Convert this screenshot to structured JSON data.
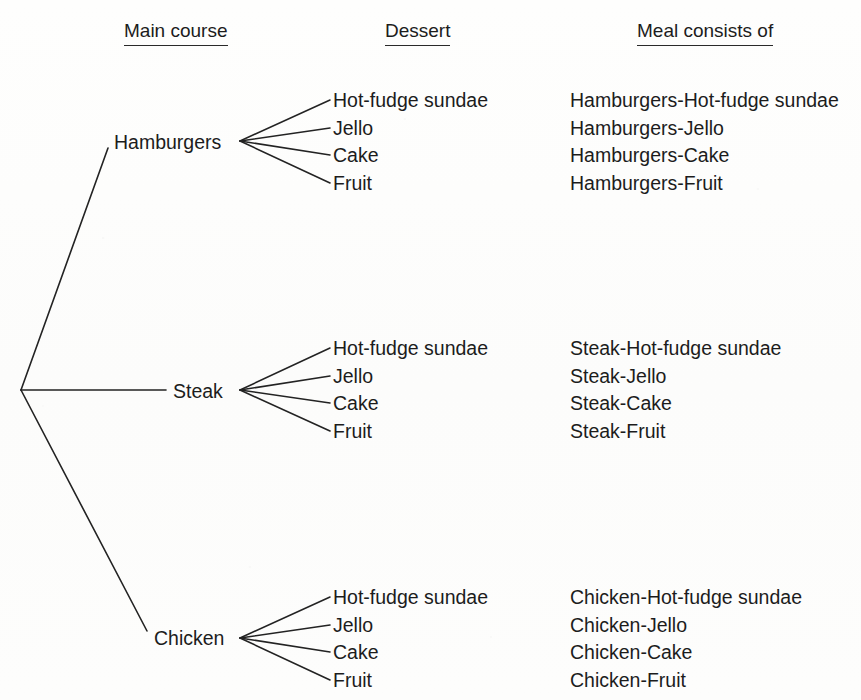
{
  "headers": [
    {
      "label": "Main course",
      "x": 124,
      "y": 20
    },
    {
      "label": "Dessert",
      "x": 385,
      "y": 20
    },
    {
      "label": "Meal consists of",
      "x": 637,
      "y": 20
    }
  ],
  "root": {
    "x": 21,
    "y": 390
  },
  "branches": [
    {
      "main_course": "Hamburgers",
      "label_x": 114,
      "label_y": 131,
      "vertex_x": 240,
      "vertex_y": 141,
      "edge_from_root_end_x": 108,
      "edge_from_root_end_y": 148,
      "desserts": [
        {
          "label": "Hot-fudge sundae",
          "meal": "Hamburgers-Hot-fudge sundae",
          "y": 89,
          "tip_x": 330
        },
        {
          "label": "Jello",
          "meal": "Hamburgers-Jello",
          "y": 117,
          "tip_x": 330
        },
        {
          "label": "Cake",
          "meal": "Hamburgers-Cake",
          "y": 144,
          "tip_x": 330
        },
        {
          "label": "Fruit",
          "meal": "Hamburgers-Fruit",
          "y": 172,
          "tip_x": 330
        }
      ]
    },
    {
      "main_course": "Steak",
      "label_x": 173,
      "label_y": 380,
      "vertex_x": 240,
      "vertex_y": 390,
      "edge_from_root_end_x": 166,
      "edge_from_root_end_y": 390,
      "desserts": [
        {
          "label": "Hot-fudge sundae",
          "meal": "Steak-Hot-fudge sundae",
          "y": 337,
          "tip_x": 330
        },
        {
          "label": "Jello",
          "meal": "Steak-Jello",
          "y": 365,
          "tip_x": 330
        },
        {
          "label": "Cake",
          "meal": "Steak-Cake",
          "y": 392,
          "tip_x": 330
        },
        {
          "label": "Fruit",
          "meal": "Steak-Fruit",
          "y": 420,
          "tip_x": 330
        }
      ]
    },
    {
      "main_course": "Chicken",
      "label_x": 154,
      "label_y": 627,
      "vertex_x": 240,
      "vertex_y": 638,
      "edge_from_root_end_x": 147,
      "edge_from_root_end_y": 631,
      "desserts": [
        {
          "label": "Hot-fudge sundae",
          "meal": "Chicken-Hot-fudge sundae",
          "y": 586,
          "tip_x": 330
        },
        {
          "label": "Jello",
          "meal": "Chicken-Jello",
          "y": 614,
          "tip_x": 330
        },
        {
          "label": "Cake",
          "meal": "Chicken-Cake",
          "y": 641,
          "tip_x": 330
        },
        {
          "label": "Fruit",
          "meal": "Chicken-Fruit",
          "y": 669,
          "tip_x": 330
        }
      ]
    }
  ],
  "layout": {
    "dessert_text_x": 333,
    "meal_text_x": 570,
    "stroke_color": "#232323",
    "stroke_width": 1.6,
    "background": "#fdfdfc"
  }
}
